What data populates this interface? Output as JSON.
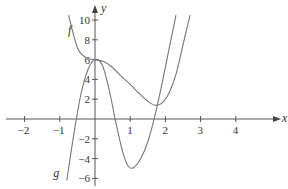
{
  "chart_data": {
    "type": "line",
    "title": "",
    "xlabel": "x",
    "ylabel": "y",
    "xlim": [
      -2.5,
      4.8
    ],
    "ylim": [
      -6.5,
      11
    ],
    "grid": false,
    "x_ticks": [
      "-2",
      "-1",
      "1",
      "2",
      "3",
      "4"
    ],
    "y_ticks": [
      "10",
      "8",
      "6",
      "4",
      "2",
      "-2",
      "-4",
      "-6"
    ],
    "series": [
      {
        "name": "f",
        "label_position": [
          -0.6,
          9
        ],
        "points": [
          [
            -0.75,
            10.5
          ],
          [
            -0.5,
            7.2
          ],
          [
            -0.25,
            6.2
          ],
          [
            0,
            6
          ],
          [
            0.25,
            5.8
          ],
          [
            0.5,
            5.2
          ],
          [
            0.75,
            4.3
          ],
          [
            1,
            3.5
          ],
          [
            1.25,
            2.6
          ],
          [
            1.5,
            1.8
          ],
          [
            1.7,
            1.4
          ],
          [
            1.9,
            1.6
          ],
          [
            2.1,
            2.6
          ],
          [
            2.3,
            4.5
          ],
          [
            2.5,
            7.5
          ],
          [
            2.7,
            10.5
          ]
        ]
      },
      {
        "name": "g",
        "label_position": [
          -0.9,
          -5.5
        ],
        "points": [
          [
            -0.8,
            -6.2
          ],
          [
            -0.6,
            -1.5
          ],
          [
            -0.4,
            2.5
          ],
          [
            -0.2,
            5
          ],
          [
            0,
            6
          ],
          [
            0.2,
            5.5
          ],
          [
            0.4,
            3
          ],
          [
            0.6,
            -0.5
          ],
          [
            0.8,
            -3.5
          ],
          [
            0.95,
            -4.8
          ],
          [
            1.1,
            -4.9
          ],
          [
            1.3,
            -4
          ],
          [
            1.5,
            -2.3
          ],
          [
            1.7,
            0.3
          ],
          [
            1.9,
            3.5
          ],
          [
            2.1,
            7
          ],
          [
            2.3,
            10.5
          ]
        ]
      }
    ]
  },
  "labels": {
    "x_axis": "x",
    "y_axis": "y",
    "f": "f",
    "g": "g"
  }
}
